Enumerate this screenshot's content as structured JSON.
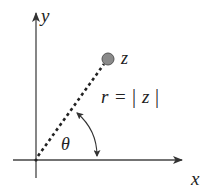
{
  "diagram": {
    "type": "polar-form-complex-number",
    "axes": {
      "x_label": "x",
      "y_label": "y"
    },
    "point": {
      "label": "z",
      "fill_color": "#8a8a8a",
      "stroke_color": "#555555"
    },
    "radius_label": {
      "r": "r",
      "equals": "=",
      "bar_left": "|",
      "z": "z",
      "bar_right": "|"
    },
    "angle_label": "θ",
    "line_color": "#333333"
  }
}
